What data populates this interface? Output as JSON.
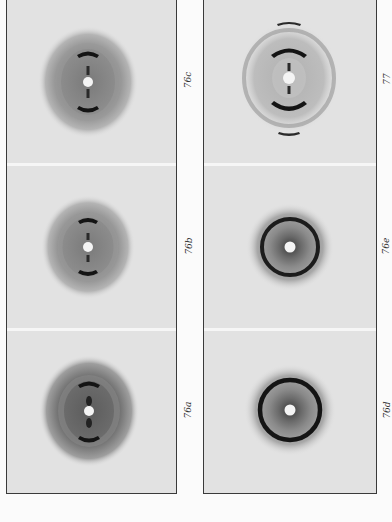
{
  "figure": {
    "left_column": [
      {
        "label": "76c",
        "pattern": "arcs-with-halo",
        "arc_count": 2
      },
      {
        "label": "76b",
        "pattern": "arcs-with-halo",
        "arc_count": 2
      },
      {
        "label": "76a",
        "pattern": "arcs-with-dark-halo",
        "arc_count": 2
      }
    ],
    "right_column": [
      {
        "label": "77",
        "pattern": "double-arcs-with-faint-ring",
        "arc_count": 4
      },
      {
        "label": "76e",
        "pattern": "ring",
        "arc_count": 0
      },
      {
        "label": "76d",
        "pattern": "ring",
        "arc_count": 0
      }
    ]
  },
  "colors": {
    "background": "#fbfbfb",
    "film": "#e2e2e2",
    "frame": "#3a3a3a",
    "arc": "#141414",
    "halo": "#8a8a8a",
    "beam_spot": "#f4f4f4"
  }
}
